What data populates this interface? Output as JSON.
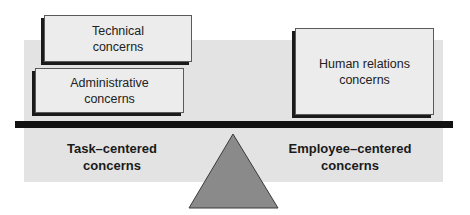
{
  "diagram": {
    "title": "",
    "left_side": {
      "boxes": [
        {
          "id": "technical",
          "line1": "Technical",
          "line2": "concerns"
        },
        {
          "id": "administrative",
          "line1": "Administrative",
          "line2": "concerns"
        }
      ],
      "label_line1": "Task–centered",
      "label_line2": "concerns"
    },
    "right_side": {
      "boxes": [
        {
          "id": "human-relations",
          "line1": "Human relations",
          "line2": "concerns"
        }
      ],
      "label_line1": "Employee–centered",
      "label_line2": "concerns"
    },
    "colors": {
      "panel": "#e3e3e3",
      "box_fill": "#ececec",
      "beam": "#111111",
      "fulcrum": "#8a8a8a"
    }
  }
}
